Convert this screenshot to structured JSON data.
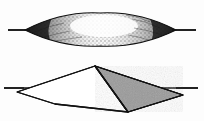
{
  "figure": {
    "title": "Two geometric solids crossed by a horizontal reference line",
    "background_color": "#fdfdfd",
    "width": 204,
    "height": 121,
    "ink_color": "#111111",
    "shaded_face_color": "#9a9a9a",
    "unshaded_face_color": "#ffffff",
    "panels": [
      {
        "id": "upper",
        "name": "stippled-lens-solid",
        "description": "Lens-shaped (lenticular) solid rendered with dense stipple shading, dark at both pointed ends and light in the centre, intersected by a horizontal line.",
        "outline": {
          "left_vertex": {
            "x": 25,
            "y": 30
          },
          "right_vertex": {
            "x": 176,
            "y": 30
          },
          "top_apex": {
            "x": 100,
            "y": 13
          },
          "bottom_apex": {
            "x": 100,
            "y": 46
          }
        },
        "reference_line": {
          "name": "horizontal-section-line",
          "x1": 8,
          "x2": 196,
          "y": 30,
          "stroke_width": 1.4
        },
        "shading": {
          "style": "stipple",
          "dark_zones": [
            "left-end",
            "right-end"
          ],
          "light_zone": "center",
          "dot_count": 520
        }
      },
      {
        "id": "lower",
        "name": "faceted-pyramid-solid",
        "description": "Four-sided pyramidal solid seen in oblique projection; the right-hand face is shaded mid-grey, the left face is left white. A horizontal line passes through the left and right base vertices.",
        "vertices": {
          "apex": {
            "x": 95,
            "y": 66
          },
          "left": {
            "x": 17,
            "y": 92
          },
          "right": {
            "x": 183,
            "y": 95
          },
          "bottom": {
            "x": 128,
            "y": 112
          },
          "front_low": {
            "x": 55,
            "y": 104
          }
        },
        "faces": [
          {
            "name": "left-face",
            "fill": "#ffffff",
            "points": "95,66 17,92 55,104 128,112"
          },
          {
            "name": "right-face",
            "fill": "#9a9a9a",
            "points": "95,66 183,95 128,112"
          }
        ],
        "reference_line": {
          "name": "horizontal-section-line",
          "x1": 4,
          "x2": 198,
          "y": 88,
          "stroke_width": 1.4
        }
      }
    ]
  }
}
